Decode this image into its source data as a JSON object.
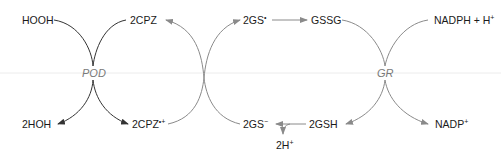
{
  "diagram": {
    "title": "",
    "colors": {
      "black_arrow": "#333333",
      "grey_arrow": "#8a8a8a",
      "enzyme_text": "#7a7a7a",
      "divider": "#e8e8e8"
    },
    "enzymes": {
      "pod": "POD",
      "gr": "GR"
    },
    "nodes": {
      "hooh": "HOOH",
      "hoh": "2HOH",
      "cpz_top": "2CPZ",
      "cpz_bottom_base": "2CPZ",
      "cpz_bottom_sup": "•+",
      "gs_radical_base": "2GS",
      "gs_radical_sup": "•",
      "gssg": "GSSG",
      "nadph_base": "NADPH + H",
      "nadph_sup": "+",
      "nadp_base": "NADP",
      "nadp_sup": "+",
      "gs_anion_base": "2GS",
      "gs_anion_sup": "−",
      "gsh": "2GSH",
      "h_base": "2H",
      "h_sup": "+"
    },
    "edges": [
      {
        "from": "HOOH",
        "to": "2HOH",
        "via": "POD"
      },
      {
        "from": "2CPZ",
        "to": "2CPZ•+",
        "via": "POD"
      },
      {
        "from": "2CPZ•+",
        "to": "2GS•"
      },
      {
        "from": "2GS−",
        "to": "2CPZ"
      },
      {
        "from": "2GS•",
        "to": "GSSG"
      },
      {
        "from": "GSSG",
        "to": "2GSH",
        "via": "GR"
      },
      {
        "from": "NADPH + H+",
        "to": "NADP+",
        "via": "GR"
      },
      {
        "from": "2GSH",
        "to": "2GS−",
        "side_product": "2H+"
      }
    ]
  }
}
